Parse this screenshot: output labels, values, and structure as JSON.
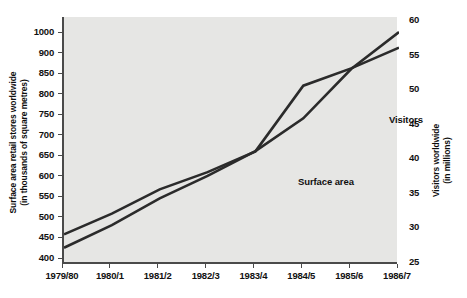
{
  "chart_data": {
    "type": "line",
    "title": "",
    "xlabel": "",
    "grid": false,
    "legend_position": "inline-annotation",
    "x": [
      "1979/80",
      "1980/1",
      "1981/2",
      "1982/3",
      "1983/4",
      "1984/5",
      "1985/6",
      "1986/7"
    ],
    "axes": {
      "left": {
        "label_line1": "Surface area retail stores worldwide",
        "label_line2": "(in thousands of square metres)",
        "ticks": [
          1000,
          900,
          850,
          800,
          750,
          700,
          650,
          600,
          550,
          500,
          450,
          400
        ],
        "unit": "thousands of square metres",
        "scale": "ordinal-spaced"
      },
      "right": {
        "label_line1": "Visitors worldwide",
        "label_line2": "(in millions)",
        "ticks": [
          60,
          55,
          50,
          45,
          40,
          35,
          30,
          25
        ],
        "ylim": [
          25,
          60
        ],
        "unit": "millions"
      }
    },
    "series": [
      {
        "name": "Surface area",
        "axis": "left",
        "unit": "thousands of square metres",
        "values": [
          425,
          480,
          545,
          600,
          660,
          740,
          860,
          1000
        ]
      },
      {
        "name": "Visitors",
        "axis": "right",
        "unit": "millions",
        "values": [
          29.0,
          32.0,
          35.5,
          38.0,
          41.0,
          50.5,
          53.0,
          56.0
        ]
      }
    ],
    "annotations": [
      {
        "text": "Visitors",
        "series": "Visitors"
      },
      {
        "text": "Surface area",
        "series": "Surface area"
      }
    ],
    "colors": {
      "plot_background": "#e6e6e4",
      "page_background": "#ffffff",
      "axis": "#4a4a4a",
      "line": "#2b2b2b",
      "text": "#111111"
    }
  }
}
